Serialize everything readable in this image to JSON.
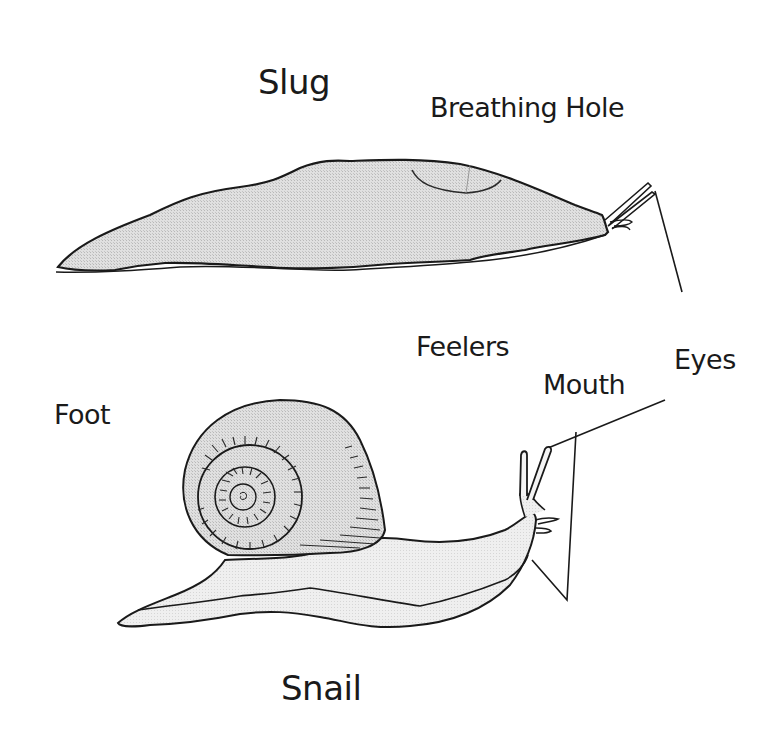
{
  "diagram": {
    "title_top": "Slug",
    "title_bottom": "Snail",
    "labels": {
      "breathing_hole": "Breathing Hole",
      "feelers": "Feelers",
      "eyes": "Eyes",
      "mouth": "Mouth",
      "foot": "Foot"
    },
    "colors": {
      "body_fill": "#d9d9d9",
      "snail_body_fill": "#ededed",
      "outline": "#1a1a1a",
      "background": "#ffffff"
    }
  }
}
